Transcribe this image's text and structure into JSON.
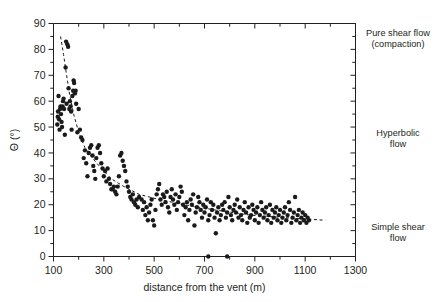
{
  "chart_data": {
    "type": "scatter",
    "title": "",
    "xlabel": "distance from the vent (m)",
    "ylabel": "Θ (°)",
    "xlim": [
      100,
      1300
    ],
    "ylim": [
      0,
      90
    ],
    "xticks": [
      100,
      300,
      500,
      700,
      900,
      1100,
      1300
    ],
    "xtick_labels": [
      "100",
      "300",
      "500",
      "700",
      "900",
      "1100",
      "1300"
    ],
    "x_minor_step": 100,
    "yticks": [
      0,
      10,
      20,
      30,
      40,
      50,
      60,
      70,
      80,
      90
    ],
    "ytick_labels": [
      "0",
      "10",
      "20",
      "30",
      "40",
      "50",
      "60",
      "70",
      "80",
      "90"
    ],
    "y_minor_step": 5,
    "grid": false,
    "legend": "none",
    "marker": "filled-circle",
    "marker_color": "#1a1a1a",
    "marker_size_px": 4.4,
    "series": [
      {
        "name": "measurements",
        "points": [
          [
            115,
            51
          ],
          [
            117,
            54
          ],
          [
            118,
            56
          ],
          [
            120,
            62
          ],
          [
            122,
            53
          ],
          [
            124,
            49
          ],
          [
            126,
            57
          ],
          [
            128,
            58
          ],
          [
            130,
            55
          ],
          [
            132,
            52
          ],
          [
            134,
            50
          ],
          [
            136,
            58
          ],
          [
            138,
            60
          ],
          [
            140,
            61
          ],
          [
            142,
            57
          ],
          [
            145,
            47
          ],
          [
            148,
            73
          ],
          [
            150,
            83
          ],
          [
            152,
            59
          ],
          [
            155,
            82
          ],
          [
            158,
            81
          ],
          [
            160,
            65
          ],
          [
            163,
            57
          ],
          [
            165,
            60
          ],
          [
            168,
            58
          ],
          [
            170,
            56
          ],
          [
            172,
            49
          ],
          [
            175,
            62
          ],
          [
            178,
            64
          ],
          [
            180,
            68
          ],
          [
            182,
            67
          ],
          [
            185,
            63
          ],
          [
            188,
            64
          ],
          [
            190,
            59
          ],
          [
            195,
            48
          ],
          [
            200,
            57
          ],
          [
            205,
            49
          ],
          [
            210,
            46
          ],
          [
            215,
            45
          ],
          [
            220,
            38
          ],
          [
            225,
            41
          ],
          [
            230,
            36
          ],
          [
            235,
            31
          ],
          [
            240,
            40
          ],
          [
            245,
            42
          ],
          [
            250,
            43
          ],
          [
            255,
            39
          ],
          [
            258,
            35
          ],
          [
            262,
            33
          ],
          [
            266,
            30
          ],
          [
            270,
            38
          ],
          [
            275,
            42
          ],
          [
            280,
            43
          ],
          [
            285,
            40
          ],
          [
            290,
            36
          ],
          [
            295,
            34
          ],
          [
            300,
            31
          ],
          [
            305,
            33
          ],
          [
            310,
            29
          ],
          [
            315,
            34
          ],
          [
            320,
            30
          ],
          [
            325,
            28
          ],
          [
            330,
            26
          ],
          [
            335,
            26
          ],
          [
            340,
            27
          ],
          [
            345,
            25
          ],
          [
            350,
            24
          ],
          [
            355,
            27
          ],
          [
            360,
            31
          ],
          [
            365,
            39
          ],
          [
            370,
            40
          ],
          [
            375,
            37
          ],
          [
            380,
            35
          ],
          [
            385,
            33
          ],
          [
            390,
            29
          ],
          [
            395,
            27
          ],
          [
            400,
            25
          ],
          [
            405,
            23
          ],
          [
            410,
            22
          ],
          [
            415,
            24
          ],
          [
            420,
            21
          ],
          [
            425,
            20
          ],
          [
            430,
            22
          ],
          [
            435,
            19
          ],
          [
            440,
            23
          ],
          [
            450,
            22
          ],
          [
            455,
            18
          ],
          [
            460,
            21
          ],
          [
            465,
            16
          ],
          [
            470,
            19
          ],
          [
            475,
            14
          ],
          [
            480,
            17
          ],
          [
            485,
            20
          ],
          [
            490,
            22
          ],
          [
            495,
            14
          ],
          [
            500,
            12
          ],
          [
            505,
            18
          ],
          [
            510,
            24
          ],
          [
            515,
            26
          ],
          [
            520,
            28
          ],
          [
            525,
            22
          ],
          [
            530,
            20
          ],
          [
            535,
            24
          ],
          [
            540,
            23
          ],
          [
            545,
            21
          ],
          [
            550,
            25
          ],
          [
            555,
            19
          ],
          [
            560,
            17
          ],
          [
            565,
            23
          ],
          [
            570,
            26
          ],
          [
            575,
            22
          ],
          [
            580,
            20
          ],
          [
            585,
            24
          ],
          [
            590,
            18
          ],
          [
            595,
            21
          ],
          [
            600,
            23
          ],
          [
            605,
            27
          ],
          [
            610,
            25
          ],
          [
            615,
            20
          ],
          [
            620,
            16
          ],
          [
            625,
            19
          ],
          [
            630,
            21
          ],
          [
            635,
            14
          ],
          [
            640,
            18
          ],
          [
            645,
            22
          ],
          [
            650,
            20
          ],
          [
            655,
            24
          ],
          [
            660,
            12
          ],
          [
            665,
            17
          ],
          [
            670,
            19
          ],
          [
            675,
            23
          ],
          [
            680,
            21
          ],
          [
            685,
            18
          ],
          [
            690,
            15
          ],
          [
            695,
            20
          ],
          [
            700,
            17
          ],
          [
            705,
            19
          ],
          [
            710,
            22
          ],
          [
            715,
            14
          ],
          [
            720,
            16
          ],
          [
            725,
            21
          ],
          [
            730,
            18
          ],
          [
            735,
            20
          ],
          [
            740,
            15
          ],
          [
            745,
            9
          ],
          [
            750,
            17
          ],
          [
            755,
            19
          ],
          [
            760,
            14
          ],
          [
            765,
            16
          ],
          [
            770,
            20
          ],
          [
            775,
            18
          ],
          [
            780,
            21
          ],
          [
            785,
            15
          ],
          [
            790,
            17
          ],
          [
            795,
            23
          ],
          [
            800,
            19
          ],
          [
            805,
            16
          ],
          [
            810,
            14
          ],
          [
            815,
            18
          ],
          [
            820,
            20
          ],
          [
            825,
            17
          ],
          [
            830,
            22
          ],
          [
            835,
            15
          ],
          [
            840,
            19
          ],
          [
            845,
            16
          ],
          [
            850,
            14
          ],
          [
            855,
            18
          ],
          [
            860,
            21
          ],
          [
            865,
            17
          ],
          [
            870,
            13
          ],
          [
            875,
            19
          ],
          [
            880,
            15
          ],
          [
            885,
            16
          ],
          [
            890,
            20
          ],
          [
            895,
            18
          ],
          [
            900,
            14
          ],
          [
            905,
            17
          ],
          [
            910,
            19
          ],
          [
            915,
            13
          ],
          [
            920,
            16
          ],
          [
            925,
            21
          ],
          [
            930,
            18
          ],
          [
            935,
            15
          ],
          [
            940,
            17
          ],
          [
            945,
            19
          ],
          [
            950,
            14
          ],
          [
            955,
            16
          ],
          [
            960,
            20
          ],
          [
            965,
            13
          ],
          [
            970,
            18
          ],
          [
            975,
            15
          ],
          [
            980,
            17
          ],
          [
            985,
            19
          ],
          [
            990,
            14
          ],
          [
            995,
            16
          ],
          [
            1000,
            18
          ],
          [
            1005,
            13
          ],
          [
            1010,
            15
          ],
          [
            1015,
            17
          ],
          [
            1020,
            19
          ],
          [
            1025,
            14
          ],
          [
            1030,
            16
          ],
          [
            1035,
            21
          ],
          [
            1040,
            18
          ],
          [
            1045,
            13
          ],
          [
            1050,
            15
          ],
          [
            1055,
            17
          ],
          [
            1060,
            23
          ],
          [
            1065,
            14
          ],
          [
            1070,
            16
          ],
          [
            1075,
            18
          ],
          [
            1080,
            13
          ],
          [
            1085,
            15
          ],
          [
            1090,
            17
          ],
          [
            1095,
            14
          ],
          [
            1100,
            16
          ],
          [
            1105,
            13
          ],
          [
            1110,
            15
          ],
          [
            1115,
            14
          ],
          [
            715,
            0
          ],
          [
            790,
            0
          ]
        ]
      }
    ],
    "trend_line": {
      "style": "dashed",
      "color": "#1a1a1a",
      "points": [
        [
          128,
          85
        ],
        [
          140,
          78
        ],
        [
          152,
          70
        ],
        [
          165,
          62
        ],
        [
          180,
          55
        ],
        [
          200,
          48
        ],
        [
          225,
          42
        ],
        [
          255,
          38
        ],
        [
          290,
          34
        ],
        [
          330,
          30
        ],
        [
          380,
          27
        ],
        [
          440,
          24
        ],
        [
          520,
          22
        ],
        [
          620,
          20
        ],
        [
          740,
          18
        ],
        [
          880,
          16
        ],
        [
          1020,
          15
        ],
        [
          1180,
          14
        ]
      ]
    },
    "annotations": [
      {
        "name": "pure-shear-flow",
        "text": "Pure shear flow\n(compaction)"
      },
      {
        "name": "hyperbolic-flow",
        "text": "Hyperbolic\nflow"
      },
      {
        "name": "simple-shear-flow",
        "text": "Simple shear\nflow"
      }
    ]
  }
}
